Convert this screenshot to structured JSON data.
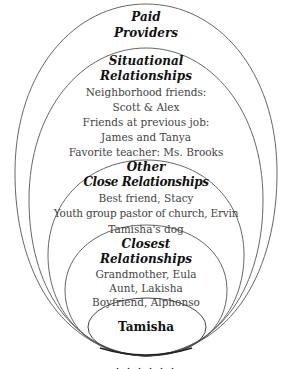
{
  "diagram": {
    "type": "nested-ellipses",
    "stroke_color": "#555555",
    "layers": [
      {
        "title_line1": "Paid",
        "title_line2": "Providers",
        "items": []
      },
      {
        "title_line1": "Situational",
        "title_line2": "Relationships",
        "items": [
          "Neighborhood friends:",
          "Scott & Alex",
          "Friends at previous job:",
          "James and Tanya",
          "Favorite teacher: Ms. Brooks"
        ]
      },
      {
        "title_line1": "Other",
        "title_line2": "Close Relationships",
        "items": [
          "Best friend, Stacy",
          "Youth group pastor of church, Ervin",
          "Tamisha's dog"
        ]
      },
      {
        "title_line1": "Closest",
        "title_line2": "Relationships",
        "items": [
          "Grandmother, Eula",
          "Aunt, Lakisha",
          "Boyfriend, Alphonso"
        ]
      }
    ],
    "center": "Tamisha",
    "caption_cutoff": "· · · · · ·"
  }
}
